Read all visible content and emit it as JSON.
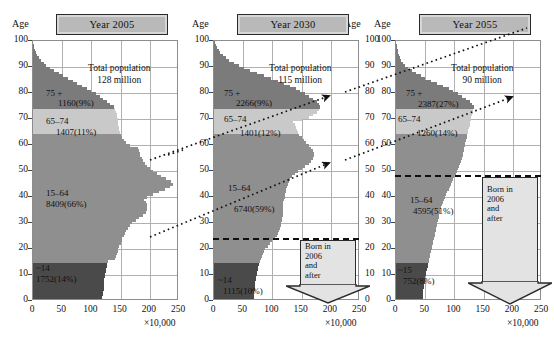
{
  "figure": {
    "axis_label_age": "Age",
    "x_unit": "×10,000",
    "y_ticks": [
      "0",
      "10",
      "20",
      "30",
      "40",
      "50",
      "60",
      "70",
      "80",
      "90",
      "100"
    ],
    "x_ticks": [
      "0",
      "50",
      "100",
      "150",
      "200",
      "250"
    ],
    "xlim": [
      0,
      250
    ],
    "ylim": [
      0,
      100
    ],
    "colors": {
      "age_75_plus": "#7b7b7b",
      "age_65_74": "#c9c9c9",
      "age_15_64": "#8f8f8f",
      "age_0_14": "#4a4a4a",
      "plaque": "#b9b9b9",
      "arrow_fill": "#e3e3e3",
      "grid": "#b0b0b0",
      "frame": "#8d8d8d"
    }
  },
  "panels": [
    {
      "id": "panel-2005",
      "title": "Year 2005",
      "total_line1": "Total population",
      "total_line2": "128 million",
      "groups": [
        {
          "key": "75+",
          "label": "75 +",
          "value": "1160(9%)"
        },
        {
          "key": "65-74",
          "label": "65–74",
          "value": "1407(11%)"
        },
        {
          "key": "15-64",
          "label": "15–64",
          "value": "8409(66%)"
        },
        {
          "key": "0-14",
          "label": "~14",
          "value": "1752(14%)"
        }
      ],
      "cohort_line_age": null,
      "born_after_box": null
    },
    {
      "id": "panel-2030",
      "title": "Year 2030",
      "total_line1": "Total population",
      "total_line2": "115 million",
      "groups": [
        {
          "key": "75+",
          "label": "75 +",
          "value": "2266(9%)"
        },
        {
          "key": "65-74",
          "label": "65–74",
          "value": "1401(12%)"
        },
        {
          "key": "15-64",
          "label": "15–64",
          "value": "6740(59%)"
        },
        {
          "key": "0-14",
          "label": "~14",
          "value": "1115(10%)"
        }
      ],
      "cohort_line_age": 24,
      "born_after_box": {
        "l1": "Born in",
        "l2": "2006",
        "l3": "and",
        "l4": "after"
      }
    },
    {
      "id": "panel-2055",
      "title": "Year 2055",
      "total_line1": "Total population",
      "total_line2": "90 million",
      "groups": [
        {
          "key": "75+",
          "label": "75 +",
          "value": "2387(27%)"
        },
        {
          "key": "65-74",
          "label": "65–74",
          "value": "1260(14%)"
        },
        {
          "key": "15-64",
          "label": "15–64",
          "value": "4595(51%)"
        },
        {
          "key": "0-14",
          "label": "~15",
          "value": "752(8%)"
        }
      ],
      "cohort_line_age": 48,
      "born_after_box": {
        "l1": "Born in",
        "l2": "2006",
        "l3": "and",
        "l4": "after"
      }
    }
  ],
  "chart_data": {
    "type": "bar",
    "xlabel": "×10,000",
    "ylabel": "Age",
    "xlim": [
      0,
      250
    ],
    "ylim": [
      0,
      100
    ],
    "grid": true,
    "legend": "none",
    "orientation": "horizontal",
    "age_axis_ticks": [
      0,
      10,
      20,
      30,
      40,
      50,
      60,
      70,
      80,
      90,
      100
    ],
    "population_axis_ticks": [
      0,
      50,
      100,
      150,
      200,
      250
    ],
    "series": [
      {
        "name": "Year 2005",
        "total_population_million": 128,
        "age_groups": [
          {
            "range": "0-14",
            "thousands_x10k": 1752,
            "percent": 14
          },
          {
            "range": "15-64",
            "thousands_x10k": 8409,
            "percent": 66
          },
          {
            "range": "65-74",
            "thousands_x10k": 1407,
            "percent": 11
          },
          {
            "range": "75+",
            "thousands_x10k": 1160,
            "percent": 9
          }
        ],
        "values_by_age": [
          118,
          119,
          120,
          120,
          121,
          121,
          122,
          122,
          122,
          123,
          124,
          125,
          125,
          126,
          127,
          128,
          140,
          142,
          143,
          145,
          146,
          148,
          150,
          152,
          153,
          155,
          158,
          160,
          163,
          166,
          170,
          176,
          182,
          188,
          193,
          196,
          196,
          195,
          193,
          190,
          196,
          206,
          216,
          226,
          234,
          240,
          236,
          228,
          220,
          213,
          206,
          200,
          196,
          192,
          188,
          186,
          184,
          183,
          182,
          180,
          166,
          160,
          155,
          152,
          150,
          149,
          148,
          147,
          146,
          146,
          145,
          144,
          143,
          142,
          140,
          138,
          132,
          126,
          120,
          114,
          108,
          100,
          92,
          84,
          76,
          68,
          60,
          52,
          44,
          36,
          29,
          23,
          18,
          13,
          10,
          7,
          5,
          3,
          2,
          1,
          0
        ]
      },
      {
        "name": "Year 2030",
        "total_population_million": 115,
        "age_groups": [
          {
            "range": "0-14",
            "thousands_x10k": 1115,
            "percent": 10
          },
          {
            "range": "15-64",
            "thousands_x10k": 6740,
            "percent": 59
          },
          {
            "range": "65-74",
            "thousands_x10k": 1401,
            "percent": 12
          },
          {
            "range": "75+",
            "thousands_x10k": 2266,
            "percent": 9
          }
        ],
        "values_by_age": [
          68,
          68,
          69,
          69,
          70,
          70,
          71,
          71,
          72,
          72,
          73,
          74,
          75,
          76,
          77,
          78,
          80,
          82,
          84,
          86,
          88,
          92,
          96,
          100,
          104,
          108,
          110,
          112,
          113,
          114,
          115,
          116,
          117,
          118,
          118,
          118,
          118,
          119,
          119,
          120,
          121,
          122,
          123,
          124,
          125,
          126,
          128,
          130,
          134,
          138,
          144,
          150,
          156,
          162,
          166,
          170,
          172,
          171,
          169,
          166,
          162,
          158,
          154,
          150,
          146,
          144,
          142,
          140,
          138,
          136,
          150,
          162,
          170,
          176,
          180,
          182,
          180,
          176,
          170,
          163,
          156,
          148,
          140,
          130,
          120,
          110,
          98,
          86,
          74,
          62,
          52,
          42,
          34,
          26,
          20,
          15,
          11,
          8,
          5,
          3,
          1
        ],
        "cohort_marker_age": 24
      },
      {
        "name": "Year 2055",
        "total_population_million": 90,
        "age_groups": [
          {
            "range": "0-14",
            "thousands_x10k": 752,
            "percent": 8
          },
          {
            "range": "15-64",
            "thousands_x10k": 4595,
            "percent": 51
          },
          {
            "range": "65-74",
            "thousands_x10k": 1260,
            "percent": 14
          },
          {
            "range": "75+",
            "thousands_x10k": 2387,
            "percent": 27
          }
        ],
        "values_by_age": [
          45,
          46,
          46,
          47,
          47,
          48,
          48,
          49,
          49,
          50,
          51,
          52,
          53,
          54,
          55,
          56,
          57,
          58,
          59,
          60,
          61,
          62,
          63,
          64,
          65,
          66,
          67,
          68,
          69,
          70,
          71,
          72,
          73,
          74,
          75,
          76,
          77,
          78,
          80,
          82,
          84,
          86,
          88,
          90,
          92,
          94,
          96,
          98,
          100,
          102,
          104,
          106,
          108,
          110,
          112,
          113,
          114,
          115,
          116,
          117,
          118,
          119,
          120,
          121,
          122,
          123,
          124,
          125,
          126,
          127,
          128,
          129,
          130,
          131,
          132,
          133,
          130,
          126,
          120,
          113,
          106,
          98,
          90,
          80,
          70,
          60,
          50,
          42,
          34,
          27,
          21,
          16,
          12,
          9,
          7,
          5,
          4,
          3,
          2,
          1,
          0
        ],
        "cohort_marker_age": 48
      }
    ]
  }
}
